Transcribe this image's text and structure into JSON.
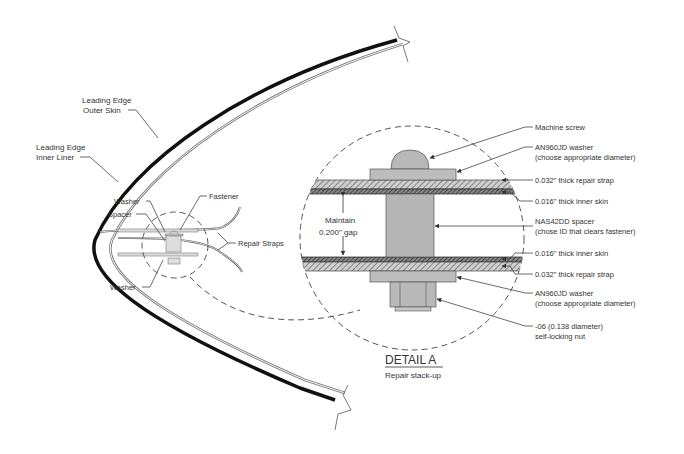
{
  "diagram": {
    "title": "DETAIL A",
    "subtitle": "Repair stack-up",
    "overview_labels": {
      "outer_skin": [
        "Leading Edge",
        "Outer Skin"
      ],
      "inner_liner": [
        "Leading Edge",
        "Inner Liner"
      ],
      "washer_top": "Washer",
      "spacer": "Spacer",
      "fastener": "Fastener",
      "repair_straps": "Repair Straps",
      "washer_bottom": "Washer"
    },
    "detail_labels": {
      "machine_screw": "Machine screw",
      "washer_top": [
        "AN960JD washer",
        "(choose appropriate diameter)"
      ],
      "strap_top": "0.032\" thick repair strap",
      "inner_skin_top": "0.016\" thick inner skin",
      "spacer": [
        "NAS42DD spacer",
        "(chose ID that clears fastener)"
      ],
      "inner_skin_bottom": "0.016\" thick inner skin",
      "strap_bottom": "0.032\" thick repair strap",
      "washer_bottom": [
        "AN960JD washer",
        "(choose appropriate diameter)"
      ],
      "nut": [
        "-06 (0.138 diameter)",
        "self-locking nut"
      ],
      "gap": [
        "Maintain",
        "0.200\" gap"
      ]
    },
    "colors": {
      "outer_skin": "#111111",
      "inner_liner": "#777777",
      "part_fill": "#b8b8b8",
      "hatch": "#555555",
      "text": "#333333"
    }
  }
}
